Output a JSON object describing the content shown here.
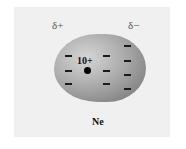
{
  "diagram": {
    "labels": {
      "delta_plus": "δ+",
      "delta_minus": "δ−",
      "nucleus_charge": "10+",
      "element": "Ne"
    },
    "electron_symbol": "−",
    "electron_count_shown": 10,
    "colors": {
      "panel_background": "#f0f0f0",
      "cloud_light": "#d6d6d6",
      "cloud_dark": "#767676",
      "nucleus": "#000000"
    }
  }
}
